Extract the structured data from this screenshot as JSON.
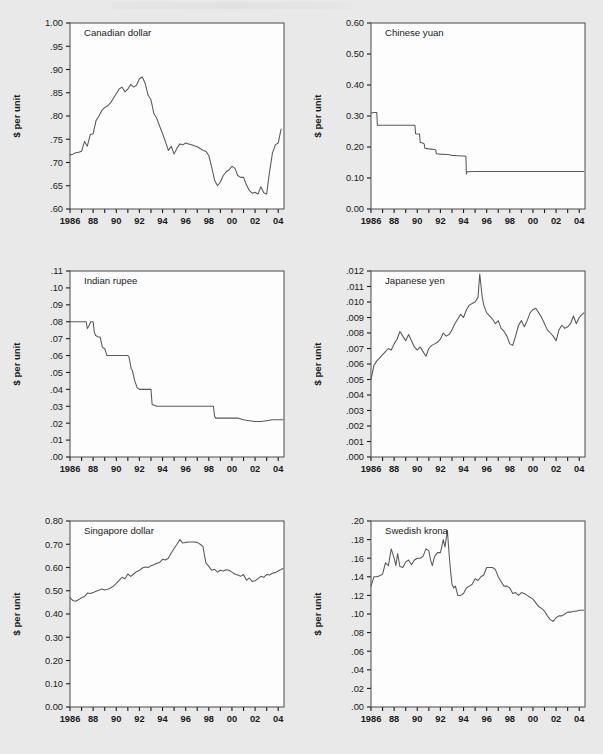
{
  "figure": {
    "background_color": "#e9e9e9",
    "plot_background_color": "#fdfdfd",
    "line_color": "#585858",
    "axis_color": "#4a4a4a",
    "shared_ylabel": "$ per unit",
    "shared_xticklabels": [
      "1986",
      "88",
      "90",
      "92",
      "94",
      "96",
      "98",
      "00",
      "02",
      "04"
    ],
    "xlim": [
      1986,
      2004.5
    ],
    "tick_years": [
      1986,
      1987,
      1988,
      1989,
      1990,
      1991,
      1992,
      1993,
      1994,
      1995,
      1996,
      1997,
      1998,
      1999,
      2000,
      2001,
      2002,
      2003,
      2004
    ]
  },
  "chart_data": [
    {
      "type": "line",
      "panel": "top-left",
      "title": "Canadian dollar",
      "xlabel": "",
      "ylabel": "$ per unit",
      "ylim": [
        0.6,
        1.0
      ],
      "yticks": [
        0.6,
        0.65,
        0.7,
        0.75,
        0.8,
        0.85,
        0.9,
        0.95,
        1.0
      ],
      "yticklabels": [
        ".60",
        ".65",
        ".70",
        ".75",
        ".80",
        ".85",
        ".90",
        ".95",
        "1.00"
      ],
      "xticklabels": [
        "1986",
        "88",
        "90",
        "92",
        "94",
        "96",
        "98",
        "00",
        "02",
        "04"
      ],
      "grid": false,
      "legend": "none",
      "x": [
        1986.0,
        1986.25,
        1986.5,
        1986.75,
        1987.0,
        1987.25,
        1987.5,
        1987.75,
        1988.0,
        1988.25,
        1988.5,
        1988.75,
        1989.0,
        1989.25,
        1989.5,
        1989.75,
        1990.0,
        1990.25,
        1990.5,
        1990.75,
        1991.0,
        1991.25,
        1991.5,
        1991.75,
        1992.0,
        1992.25,
        1992.5,
        1992.75,
        1993.0,
        1993.25,
        1993.5,
        1993.75,
        1994.0,
        1994.25,
        1994.5,
        1994.75,
        1995.0,
        1995.25,
        1995.5,
        1995.75,
        1996.0,
        1996.25,
        1996.5,
        1996.75,
        1997.0,
        1997.25,
        1997.5,
        1997.75,
        1998.0,
        1998.25,
        1998.5,
        1998.75,
        1999.0,
        1999.25,
        1999.5,
        1999.75,
        2000.0,
        2000.25,
        2000.5,
        2000.75,
        2001.0,
        2001.25,
        2001.5,
        2001.75,
        2002.0,
        2002.25,
        2002.5,
        2002.75,
        2003.0,
        2003.25,
        2003.5,
        2003.75,
        2004.0,
        2004.25
      ],
      "values": [
        0.716,
        0.718,
        0.721,
        0.722,
        0.724,
        0.745,
        0.735,
        0.76,
        0.762,
        0.79,
        0.8,
        0.812,
        0.818,
        0.822,
        0.828,
        0.838,
        0.848,
        0.858,
        0.862,
        0.852,
        0.858,
        0.868,
        0.862,
        0.866,
        0.88,
        0.884,
        0.87,
        0.845,
        0.835,
        0.805,
        0.795,
        0.778,
        0.762,
        0.745,
        0.726,
        0.735,
        0.718,
        0.731,
        0.74,
        0.738,
        0.742,
        0.74,
        0.738,
        0.736,
        0.734,
        0.73,
        0.726,
        0.724,
        0.715,
        0.69,
        0.662,
        0.65,
        0.658,
        0.672,
        0.68,
        0.684,
        0.692,
        0.688,
        0.672,
        0.668,
        0.668,
        0.652,
        0.64,
        0.634,
        0.636,
        0.632,
        0.648,
        0.635,
        0.632,
        0.68,
        0.72,
        0.738,
        0.742,
        0.772
      ]
    },
    {
      "type": "line",
      "panel": "top-right",
      "title": "Chinese yuan",
      "xlabel": "",
      "ylabel": "$ per unit",
      "ylim": [
        0.0,
        0.6
      ],
      "yticks": [
        0.0,
        0.1,
        0.2,
        0.3,
        0.4,
        0.5,
        0.6
      ],
      "yticklabels": [
        "0.00",
        "0.10",
        "0.20",
        "0.30",
        "0.40",
        "0.50",
        "0.60"
      ],
      "xticklabels": [
        "1986",
        "88",
        "90",
        "92",
        "94",
        "96",
        "98",
        "00",
        "02",
        "04"
      ],
      "grid": false,
      "legend": "none",
      "x": [
        1986.0,
        1986.3,
        1986.5,
        1986.55,
        1987.0,
        1987.5,
        1988.0,
        1988.5,
        1989.0,
        1989.5,
        1989.8,
        1989.85,
        1990.0,
        1990.2,
        1990.25,
        1990.5,
        1990.6,
        1990.65,
        1991.0,
        1991.5,
        1991.6,
        1991.65,
        1992.0,
        1992.5,
        1992.8,
        1992.9,
        1993.0,
        1993.5,
        1994.0,
        1994.2,
        1994.25,
        1994.3,
        1995.0,
        1996.0,
        1997.0,
        1998.0,
        1999.0,
        2000.0,
        2001.0,
        2002.0,
        2003.0,
        2004.0,
        2004.4
      ],
      "values": [
        0.31,
        0.311,
        0.311,
        0.27,
        0.27,
        0.27,
        0.27,
        0.27,
        0.27,
        0.27,
        0.27,
        0.243,
        0.242,
        0.242,
        0.215,
        0.212,
        0.21,
        0.196,
        0.194,
        0.192,
        0.19,
        0.178,
        0.177,
        0.176,
        0.175,
        0.174,
        0.173,
        0.172,
        0.171,
        0.17,
        0.113,
        0.12,
        0.121,
        0.121,
        0.121,
        0.121,
        0.121,
        0.121,
        0.121,
        0.121,
        0.121,
        0.121,
        0.121
      ]
    },
    {
      "type": "line",
      "panel": "middle-left",
      "title": "Indian rupee",
      "xlabel": "",
      "ylabel": "$ per unit",
      "ylim": [
        0.0,
        0.11
      ],
      "yticks": [
        0.0,
        0.01,
        0.02,
        0.03,
        0.04,
        0.05,
        0.06,
        0.07,
        0.08,
        0.09,
        0.1,
        0.11
      ],
      "yticklabels": [
        ".00",
        ".01",
        ".02",
        ".03",
        ".04",
        ".05",
        ".06",
        ".07",
        ".08",
        ".09",
        ".10",
        ".11"
      ],
      "xticklabels": [
        "1986",
        "88",
        "90",
        "92",
        "94",
        "96",
        "98",
        "00",
        "02",
        "04"
      ],
      "grid": false,
      "legend": "none",
      "x": [
        1986.0,
        1986.5,
        1987.0,
        1987.4,
        1987.5,
        1987.6,
        1987.8,
        1988.0,
        1988.1,
        1988.2,
        1988.4,
        1988.6,
        1988.8,
        1989.0,
        1989.2,
        1989.5,
        1990.0,
        1990.5,
        1991.0,
        1991.1,
        1991.3,
        1991.4,
        1991.6,
        1991.8,
        1992.0,
        1992.2,
        1992.5,
        1992.8,
        1993.0,
        1993.1,
        1993.5,
        1994.0,
        1995.0,
        1996.0,
        1997.0,
        1998.0,
        1998.4,
        1998.5,
        1998.6,
        1999.0,
        1999.5,
        2000.0,
        2000.5,
        2001.0,
        2001.5,
        2002.0,
        2002.5,
        2003.0,
        2003.5,
        2004.0,
        2004.4
      ],
      "values": [
        0.08,
        0.08,
        0.08,
        0.08,
        0.076,
        0.077,
        0.08,
        0.08,
        0.074,
        0.072,
        0.071,
        0.071,
        0.065,
        0.064,
        0.06,
        0.06,
        0.06,
        0.06,
        0.06,
        0.059,
        0.052,
        0.051,
        0.045,
        0.041,
        0.04,
        0.04,
        0.04,
        0.04,
        0.04,
        0.031,
        0.03,
        0.03,
        0.03,
        0.03,
        0.03,
        0.03,
        0.03,
        0.024,
        0.023,
        0.023,
        0.023,
        0.023,
        0.023,
        0.022,
        0.0215,
        0.021,
        0.021,
        0.0215,
        0.022,
        0.022,
        0.022
      ]
    },
    {
      "type": "line",
      "panel": "middle-right",
      "title": "Japanese yen",
      "xlabel": "",
      "ylabel": "$ per unit",
      "ylim": [
        0.0,
        0.012
      ],
      "yticks": [
        0.0,
        0.001,
        0.002,
        0.003,
        0.004,
        0.005,
        0.006,
        0.007,
        0.008,
        0.009,
        0.01,
        0.011,
        0.012
      ],
      "yticklabels": [
        ".000",
        ".001",
        ".002",
        ".003",
        ".004",
        ".005",
        ".006",
        ".007",
        ".008",
        ".009",
        ".010",
        ".011",
        ".012"
      ],
      "xticklabels": [
        "1986",
        "88",
        "90",
        "92",
        "94",
        "96",
        "98",
        "00",
        "02",
        "04"
      ],
      "grid": false,
      "legend": "none",
      "x": [
        1986.0,
        1986.25,
        1986.5,
        1986.75,
        1987.0,
        1987.25,
        1987.5,
        1987.75,
        1988.0,
        1988.25,
        1988.5,
        1988.75,
        1989.0,
        1989.25,
        1989.5,
        1989.75,
        1990.0,
        1990.25,
        1990.5,
        1990.75,
        1991.0,
        1991.25,
        1991.5,
        1991.75,
        1992.0,
        1992.25,
        1992.5,
        1992.75,
        1993.0,
        1993.25,
        1993.5,
        1993.75,
        1994.0,
        1994.25,
        1994.5,
        1994.75,
        1995.0,
        1995.25,
        1995.4,
        1995.6,
        1995.75,
        1996.0,
        1996.25,
        1996.5,
        1996.75,
        1997.0,
        1997.25,
        1997.5,
        1997.75,
        1998.0,
        1998.25,
        1998.5,
        1998.75,
        1999.0,
        1999.25,
        1999.5,
        1999.75,
        2000.0,
        2000.25,
        2000.5,
        2000.75,
        2001.0,
        2001.25,
        2001.5,
        2001.75,
        2002.0,
        2002.25,
        2002.5,
        2002.75,
        2003.0,
        2003.25,
        2003.5,
        2003.75,
        2004.0,
        2004.25,
        2004.4
      ],
      "values": [
        0.005,
        0.0059,
        0.0062,
        0.0064,
        0.0066,
        0.0068,
        0.007,
        0.0069,
        0.0073,
        0.0076,
        0.0081,
        0.0078,
        0.0075,
        0.0079,
        0.0075,
        0.0071,
        0.0069,
        0.0071,
        0.0068,
        0.0065,
        0.007,
        0.0072,
        0.0073,
        0.0074,
        0.0076,
        0.008,
        0.0078,
        0.0079,
        0.0082,
        0.0086,
        0.0089,
        0.0092,
        0.009,
        0.0095,
        0.0098,
        0.0099,
        0.01,
        0.0103,
        0.0118,
        0.0104,
        0.0098,
        0.0093,
        0.0091,
        0.0089,
        0.0086,
        0.0088,
        0.0083,
        0.0081,
        0.0078,
        0.0073,
        0.0072,
        0.0078,
        0.0085,
        0.0088,
        0.0084,
        0.0088,
        0.0093,
        0.0095,
        0.0096,
        0.0093,
        0.009,
        0.0086,
        0.0082,
        0.008,
        0.0078,
        0.0075,
        0.0082,
        0.0085,
        0.0083,
        0.0084,
        0.0086,
        0.0091,
        0.0086,
        0.009,
        0.0092,
        0.0093
      ]
    },
    {
      "type": "line",
      "panel": "bottom-left",
      "title": "Singapore dollar",
      "xlabel": "",
      "ylabel": "$ per unit",
      "ylim": [
        0.0,
        0.8
      ],
      "yticks": [
        0.0,
        0.1,
        0.2,
        0.3,
        0.4,
        0.5,
        0.6,
        0.7,
        0.8
      ],
      "yticklabels": [
        "0.00",
        "0.10",
        "0.20",
        "0.30",
        "0.40",
        "0.50",
        "0.60",
        "0.70",
        "0.80"
      ],
      "xticklabels": [
        "1986",
        "88",
        "90",
        "92",
        "94",
        "96",
        "98",
        "00",
        "02",
        "04"
      ],
      "grid": false,
      "legend": "none",
      "x": [
        1986.0,
        1986.25,
        1986.5,
        1986.75,
        1987.0,
        1987.25,
        1987.5,
        1987.75,
        1988.0,
        1988.25,
        1988.5,
        1988.75,
        1989.0,
        1989.25,
        1989.5,
        1989.75,
        1990.0,
        1990.25,
        1990.5,
        1990.75,
        1991.0,
        1991.25,
        1991.5,
        1991.75,
        1992.0,
        1992.25,
        1992.5,
        1992.75,
        1993.0,
        1993.25,
        1993.5,
        1993.75,
        1994.0,
        1994.25,
        1994.5,
        1994.75,
        1995.0,
        1995.25,
        1995.5,
        1995.75,
        1996.0,
        1996.25,
        1996.5,
        1996.75,
        1997.0,
        1997.25,
        1997.5,
        1997.6,
        1997.75,
        1998.0,
        1998.25,
        1998.5,
        1998.75,
        1999.0,
        1999.25,
        1999.5,
        1999.75,
        2000.0,
        2000.25,
        2000.5,
        2000.75,
        2001.0,
        2001.25,
        2001.5,
        2001.75,
        2002.0,
        2002.25,
        2002.5,
        2002.75,
        2003.0,
        2003.25,
        2003.5,
        2003.75,
        2004.0,
        2004.25,
        2004.4
      ],
      "values": [
        0.47,
        0.458,
        0.455,
        0.462,
        0.47,
        0.475,
        0.49,
        0.488,
        0.492,
        0.498,
        0.502,
        0.508,
        0.503,
        0.506,
        0.512,
        0.52,
        0.532,
        0.545,
        0.558,
        0.552,
        0.572,
        0.562,
        0.572,
        0.582,
        0.588,
        0.598,
        0.602,
        0.6,
        0.608,
        0.612,
        0.618,
        0.622,
        0.635,
        0.632,
        0.64,
        0.662,
        0.682,
        0.7,
        0.72,
        0.705,
        0.708,
        0.71,
        0.71,
        0.71,
        0.708,
        0.7,
        0.69,
        0.66,
        0.62,
        0.605,
        0.588,
        0.592,
        0.58,
        0.588,
        0.585,
        0.59,
        0.588,
        0.58,
        0.572,
        0.568,
        0.562,
        0.57,
        0.545,
        0.555,
        0.54,
        0.543,
        0.552,
        0.562,
        0.558,
        0.57,
        0.568,
        0.575,
        0.578,
        0.585,
        0.592,
        0.595
      ]
    },
    {
      "type": "line",
      "panel": "bottom-right",
      "title": "Swedish krona",
      "xlabel": "",
      "ylabel": "$ per unit",
      "ylim": [
        0.0,
        0.2
      ],
      "yticks": [
        0.0,
        0.02,
        0.04,
        0.06,
        0.08,
        0.1,
        0.12,
        0.14,
        0.16,
        0.18,
        0.2
      ],
      "yticklabels": [
        ".00",
        ".02",
        ".04",
        ".06",
        ".08",
        ".10",
        ".12",
        ".14",
        ".16",
        ".18",
        ".20"
      ],
      "xticklabels": [
        "1986",
        "88",
        "90",
        "92",
        "94",
        "96",
        "98",
        "00",
        "02",
        "04"
      ],
      "grid": false,
      "legend": "none",
      "x": [
        1986.0,
        1986.25,
        1986.5,
        1986.75,
        1987.0,
        1987.25,
        1987.5,
        1987.75,
        1988.0,
        1988.15,
        1988.3,
        1988.5,
        1988.75,
        1989.0,
        1989.25,
        1989.5,
        1989.75,
        1990.0,
        1990.25,
        1990.5,
        1990.75,
        1991.0,
        1991.15,
        1991.3,
        1991.5,
        1991.75,
        1992.0,
        1992.25,
        1992.4,
        1992.6,
        1992.75,
        1992.85,
        1993.0,
        1993.15,
        1993.3,
        1993.5,
        1993.75,
        1994.0,
        1994.25,
        1994.5,
        1994.75,
        1995.0,
        1995.25,
        1995.5,
        1995.75,
        1996.0,
        1996.25,
        1996.5,
        1996.75,
        1997.0,
        1997.25,
        1997.5,
        1997.75,
        1998.0,
        1998.25,
        1998.5,
        1998.75,
        1999.0,
        1999.25,
        1999.5,
        1999.75,
        2000.0,
        2000.25,
        2000.5,
        2000.75,
        2001.0,
        2001.25,
        2001.5,
        2001.75,
        2002.0,
        2002.25,
        2002.5,
        2002.75,
        2003.0,
        2003.25,
        2003.5,
        2003.75,
        2004.0,
        2004.25,
        2004.4
      ],
      "values": [
        0.13,
        0.14,
        0.14,
        0.141,
        0.143,
        0.155,
        0.152,
        0.17,
        0.16,
        0.152,
        0.165,
        0.151,
        0.15,
        0.156,
        0.158,
        0.153,
        0.158,
        0.16,
        0.16,
        0.162,
        0.17,
        0.168,
        0.158,
        0.152,
        0.162,
        0.166,
        0.166,
        0.18,
        0.172,
        0.19,
        0.165,
        0.15,
        0.132,
        0.128,
        0.13,
        0.12,
        0.12,
        0.122,
        0.128,
        0.13,
        0.132,
        0.138,
        0.136,
        0.14,
        0.142,
        0.15,
        0.15,
        0.15,
        0.148,
        0.14,
        0.135,
        0.13,
        0.13,
        0.128,
        0.122,
        0.123,
        0.12,
        0.123,
        0.122,
        0.12,
        0.118,
        0.116,
        0.112,
        0.108,
        0.106,
        0.103,
        0.098,
        0.094,
        0.092,
        0.096,
        0.098,
        0.098,
        0.1,
        0.102,
        0.102,
        0.103,
        0.103,
        0.104,
        0.104,
        0.104
      ]
    }
  ]
}
